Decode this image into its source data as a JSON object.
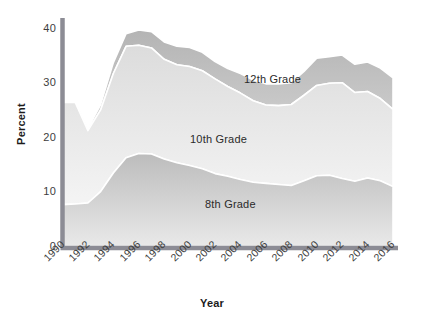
{
  "chart_data": {
    "type": "area",
    "stacked": true,
    "title": "",
    "xlabel": "Year",
    "ylabel": "Percent",
    "ylim": [
      0,
      42
    ],
    "yticks": [
      0,
      10,
      20,
      30,
      40
    ],
    "ytick_labels": [
      "0",
      "10",
      "20",
      "30",
      "40"
    ],
    "xlim": [
      1990,
      2016
    ],
    "xticks": [
      1990,
      1992,
      1994,
      1996,
      1998,
      2000,
      2002,
      2004,
      2006,
      2008,
      2010,
      2012,
      2014,
      2016
    ],
    "xtick_labels": [
      "1990",
      "1992",
      "1994",
      "1996",
      "1998",
      "2000",
      "2002",
      "2004",
      "2006",
      "2008",
      "2010",
      "2012",
      "2014",
      "2016"
    ],
    "grid": false,
    "legend_position": "inline-annotations",
    "x": [
      1990,
      1991,
      1992,
      1993,
      1994,
      1995,
      1996,
      1997,
      1998,
      1999,
      2000,
      2001,
      2002,
      2003,
      2004,
      2005,
      2006,
      2007,
      2008,
      2009,
      2010,
      2011,
      2012,
      2013,
      2014,
      2015,
      2016
    ],
    "series": [
      {
        "name": "8th Grade",
        "color": "#c9c9c9",
        "values": [
          7.7,
          7.8,
          8.0,
          10.1,
          13.5,
          16.3,
          17.1,
          17.0,
          16.1,
          15.4,
          14.9,
          14.3,
          13.4,
          12.9,
          12.3,
          11.8,
          11.6,
          11.4,
          11.2,
          12.1,
          13.0,
          13.1,
          12.5,
          12.0,
          12.6,
          12.1,
          11.0
        ]
      },
      {
        "name": "10th Grade",
        "color": "#e4e4e4",
        "values": [
          18.8,
          18.7,
          13.3,
          15.0,
          18.3,
          20.5,
          19.9,
          19.5,
          18.3,
          18.0,
          18.2,
          18.0,
          17.4,
          16.5,
          15.9,
          15.0,
          14.4,
          14.5,
          14.9,
          15.7,
          16.6,
          16.9,
          17.6,
          16.3,
          15.9,
          15.1,
          14.2
        ]
      },
      {
        "name": "12th Grade",
        "color": "#b9b9b9",
        "values": [
          0.3,
          0.2,
          0.4,
          1.0,
          2.0,
          2.3,
          2.8,
          3.0,
          3.2,
          3.4,
          3.5,
          3.4,
          3.2,
          3.3,
          3.6,
          3.8,
          3.9,
          4.0,
          4.0,
          4.4,
          5.0,
          4.9,
          5.1,
          5.2,
          5.4,
          5.6,
          5.8
        ]
      }
    ],
    "annotations": [
      {
        "text": "12th Grade",
        "x_px": 244,
        "y_px": 73
      },
      {
        "text": "10th Grade",
        "x_px": 190,
        "y_px": 133
      },
      {
        "text": "8th Grade",
        "x_px": 205,
        "y_px": 198
      }
    ],
    "axis_color": "#8c8c95",
    "text_color": "#3d3d3d",
    "background": "#ffffff"
  }
}
